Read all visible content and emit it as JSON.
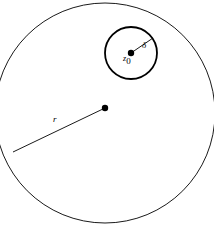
{
  "figure": {
    "background_color": "#ffffff",
    "stroke_color": "#000000",
    "width": 214,
    "height": 228
  },
  "chart_data": {
    "type": "diagram",
    "title": "",
    "xlabel": "",
    "ylabel": "",
    "background": "#ffffff",
    "shapes": [
      {
        "name": "outer-circle",
        "kind": "circle",
        "cx": 105,
        "cy": 113,
        "r": 110,
        "stroke": "#000000",
        "stroke_width": 0.9,
        "fill": "none"
      },
      {
        "name": "inner-circle",
        "kind": "circle",
        "cx": 131,
        "cy": 53,
        "r": 26,
        "stroke": "#000000",
        "stroke_width": 1.8,
        "fill": "none"
      },
      {
        "name": "outer-center-dot",
        "kind": "dot",
        "cx": 105,
        "cy": 108,
        "r": 3.2,
        "fill": "#000000"
      },
      {
        "name": "inner-center-dot",
        "kind": "dot",
        "cx": 131,
        "cy": 53,
        "r": 3.2,
        "fill": "#000000"
      },
      {
        "name": "outer-radius-line",
        "kind": "line",
        "x1": 105,
        "y1": 108,
        "x2": 13,
        "y2": 152,
        "stroke": "#000000",
        "stroke_width": 0.9
      },
      {
        "name": "inner-radius-line",
        "kind": "line",
        "x1": 131,
        "y1": 53,
        "x2": 153,
        "y2": 38,
        "stroke": "#000000",
        "stroke_width": 0.9
      }
    ],
    "annotations": [
      {
        "name": "outer-radius-label",
        "text": "r",
        "x": 56,
        "y": 120,
        "meaning": "radius of outer circle"
      },
      {
        "name": "inner-radius-label",
        "text": "δ",
        "x": 143,
        "y": 45,
        "meaning": "radius of inner neighborhood"
      },
      {
        "name": "inner-center-label",
        "text": "z",
        "subscript": "0",
        "x": 124,
        "y": 57,
        "meaning": "center point of inner circle"
      }
    ]
  },
  "labels": {
    "outer_radius": "r",
    "inner_radius": "δ",
    "center_point": "z",
    "center_point_subscript": "0"
  }
}
